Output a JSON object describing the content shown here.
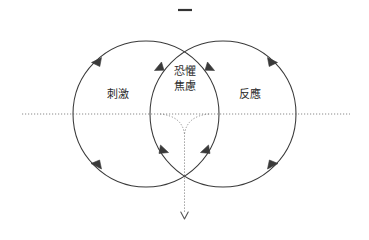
{
  "diagram": {
    "type": "venn-two-circle-cycle",
    "top_mark": "–",
    "labels": {
      "left": "刺激",
      "right": "反應",
      "center_line1": "恐懼",
      "center_line2": "焦慮"
    },
    "colors": {
      "stroke": "#3a3a3a",
      "dotted": "#8a8a8a",
      "text": "#2b2b2b",
      "background": "#ffffff"
    },
    "geometry": {
      "left_circle": {
        "cx": 146,
        "cy": 114,
        "r": 73
      },
      "right_circle": {
        "cx": 223,
        "cy": 114,
        "r": 73
      },
      "axis_y": 114,
      "axis_x_start": 22,
      "axis_x_end": 350,
      "vertical_x": 184.5,
      "vertical_y_end": 218
    },
    "arrows": {
      "outer_left_top": "up-right",
      "outer_left_bottom": "up-left",
      "outer_right_top": "up-left",
      "outer_right_bottom": "up-right",
      "lens_left_top": "down-left",
      "lens_right_top": "down-right",
      "lens_left_bottom": "down-left",
      "lens_right_bottom": "down-right",
      "axis_bottom": "down"
    }
  }
}
